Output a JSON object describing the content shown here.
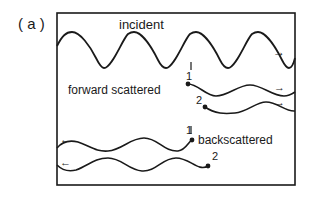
{
  "figure": {
    "panel_label": "( a )",
    "labels": {
      "incident": "incident",
      "forward": "forward scattered",
      "back": "backscattered",
      "fwd_1": "1",
      "fwd_2": "2",
      "back_1": "1",
      "back_2": "2"
    },
    "arrows": {
      "right": "→",
      "left": "←"
    },
    "colors": {
      "ink": "#1a1a1a",
      "background": "#ffffff"
    }
  }
}
